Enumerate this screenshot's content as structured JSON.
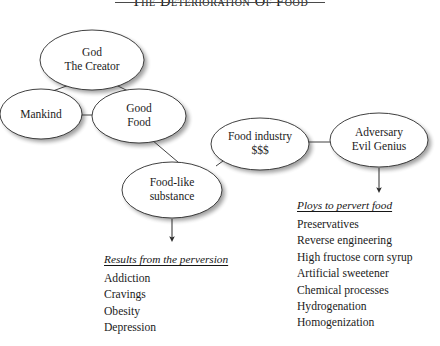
{
  "title": {
    "text": "The Deterioration of Food",
    "rule": "horizontal-rule"
  },
  "nodes": [
    {
      "id": "god",
      "line1": "God",
      "line2": "The Creator"
    },
    {
      "id": "mankind",
      "line1": "Mankind",
      "line2": ""
    },
    {
      "id": "good-food",
      "line1": "Good",
      "line2": "Food"
    },
    {
      "id": "food-like",
      "line1": "Food-like",
      "line2": "substance"
    },
    {
      "id": "food-industry",
      "line1": "Food industry",
      "line2": "$$$"
    },
    {
      "id": "adversary",
      "line1": "Adversary",
      "line2": "Evil Genius"
    }
  ],
  "edges": [
    {
      "from": "god",
      "to": "mankind",
      "type": "line"
    },
    {
      "from": "god",
      "to": "good-food",
      "type": "line"
    },
    {
      "from": "mankind",
      "to": "good-food",
      "type": "line"
    },
    {
      "from": "good-food",
      "to": "food-like",
      "type": "line"
    },
    {
      "from": "food-industry",
      "to": "food-like",
      "type": "line"
    },
    {
      "from": "food-industry",
      "to": "adversary",
      "type": "line"
    },
    {
      "from": "food-like",
      "to": "results-list",
      "type": "arrow"
    },
    {
      "from": "adversary",
      "to": "ploys-list",
      "type": "arrow"
    }
  ],
  "results_list": {
    "heading": "Results from the perversion",
    "items": [
      "Addiction",
      "Cravings",
      "Obesity",
      "Depression"
    ]
  },
  "ploys_list": {
    "heading": "Ploys to pervert food",
    "items": [
      "Preservatives",
      "Reverse engineering",
      "High fructose corn syrup",
      "Artificial sweetener",
      "Chemical processes",
      "Hydrogenation",
      "Homogenization"
    ]
  },
  "colors": {
    "background": "#ffffff",
    "text": "#1b1b1b",
    "stroke": "#2b2b2b",
    "shadow": "#b9b9b9",
    "rule": "#4a4a4a"
  }
}
